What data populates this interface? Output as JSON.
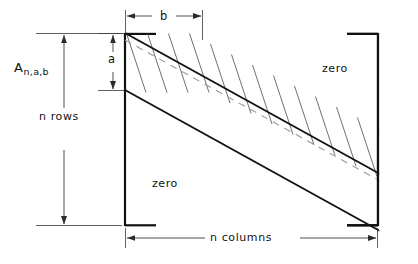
{
  "figure": {
    "kind": "banded-matrix-diagram",
    "title_label": "A",
    "matrix_symbol": "A",
    "matrix_subscript": "n,a,b",
    "labels": {
      "n_rows": "n rows",
      "n_columns": "n  columns",
      "bandwidth_b": "b",
      "bandwidth_a": "a",
      "zero_upper_right": "zero",
      "zero_lower_left": "zero"
    },
    "colors": {
      "ink": "#111111",
      "band_edge": "#111111",
      "cross_line": "#4a4a4a",
      "dashed_center": "#8c8c8c",
      "dimension": "#3a3a3a",
      "background": "#ffffff"
    },
    "geometry": {
      "bracket_left_x": 125,
      "bracket_right_x": 378,
      "bracket_top_y": 33,
      "bracket_bottom_y": 226,
      "band_upper_left": [
        125,
        33
      ],
      "band_lower_left": [
        125,
        90
      ],
      "band_upper_right": [
        378,
        165
      ],
      "band_lower_right": [
        378,
        226
      ],
      "cross_line_count": 12,
      "band_width_a_px": 57,
      "band_width_b_px": 77
    },
    "dimensions": [
      {
        "name": "n rows",
        "orientation": "vertical",
        "from": 33,
        "to": 226,
        "axis_x": 64
      },
      {
        "name": "a",
        "orientation": "vertical",
        "from": 33,
        "to": 90,
        "axis_x": 113
      },
      {
        "name": "b",
        "orientation": "horizontal",
        "from": 125,
        "to": 202,
        "axis_y": 16
      },
      {
        "name": "n columns",
        "orientation": "horizontal",
        "from": 125,
        "to": 378,
        "axis_y": 238
      }
    ]
  }
}
